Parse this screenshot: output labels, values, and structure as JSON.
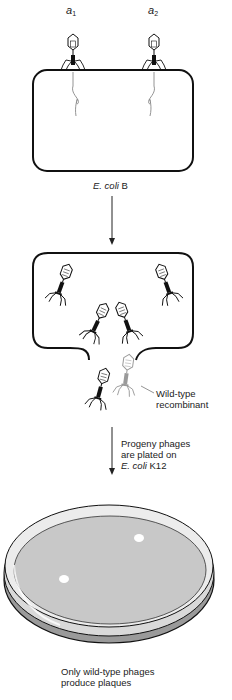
{
  "figure": {
    "type": "diagram"
  },
  "stage1": {
    "phage_labels": [
      {
        "letter": "a",
        "subscript": "1"
      },
      {
        "letter": "a",
        "subscript": "2"
      }
    ],
    "host_label_italic": "E. coli",
    "host_label_strain": " B"
  },
  "stage2": {
    "recombinant_label_line1": "Wild-type",
    "recombinant_label_line2": "recombinant"
  },
  "stage3": {
    "arrow_label_line1": "Progeny phages",
    "arrow_label_line2": "are plated on",
    "arrow_label_line3_italic": "E. coli",
    "arrow_label_line3_strain": " K12"
  },
  "stage4": {
    "plaque_count": 2,
    "caption_line1": "Only wild-type phages",
    "caption_line2": "produce plaques"
  },
  "colors": {
    "outline": "#111111",
    "agar": "#c8c8c8",
    "dish_rim": "#e2e2e2",
    "plaque": "#ffffff",
    "recombinant_phage": "#9a9a9a"
  }
}
